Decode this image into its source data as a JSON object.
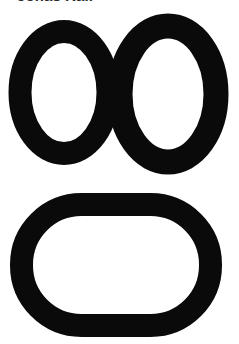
{
  "page": {
    "width": 239,
    "height": 344,
    "background_color": "#ffffff",
    "ink_color": "#0a0a0a"
  },
  "caption": {
    "text": "Jonas Rail",
    "color": "#2b2b2b",
    "clipped_at_top": "true"
  },
  "shapes": {
    "infinity": {
      "name": "infinity-symbol",
      "label": "∞",
      "description": "thick two-lobed infinity ring outline",
      "bounds": {
        "x": 8,
        "y": 21,
        "width": 220,
        "height": 147
      },
      "stroke_color": "#0a0a0a",
      "fill_color": "#ffffff"
    },
    "oval": {
      "name": "rounded-oval",
      "label": "◯",
      "description": "thick stadium / rounded-rectangle ring outline",
      "bounds": {
        "x": 10,
        "y": 193,
        "width": 212,
        "height": 144
      },
      "stroke_color": "#0a0a0a",
      "fill_color": "#ffffff"
    }
  }
}
